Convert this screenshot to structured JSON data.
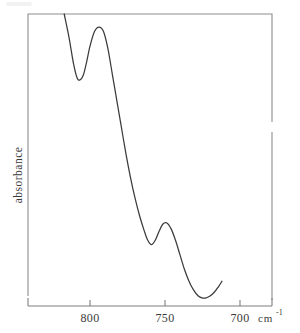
{
  "figure": {
    "name": "infrared-absorbance-spectrum",
    "background_color": "#ffffff",
    "curve_color": "#3b3b3b",
    "frame_color": "#8d8d8d"
  },
  "chart_data": {
    "type": "line",
    "title": "",
    "subtitle": "",
    "xlabel": "cm",
    "xlabel_superscript": "-1",
    "ylabel": "absorbance",
    "xticks": [
      800,
      750,
      700
    ],
    "xtick_labels": [
      "800",
      "750",
      "700"
    ],
    "xlim": [
      818,
      682
    ],
    "x_axis_direction": "decreasing",
    "ylim": [
      0,
      1
    ],
    "ytick_labels": [],
    "grid": false,
    "legend": null,
    "axis_frame": "left-top-right box with separate bottom axis line",
    "series": [
      {
        "name": "absorbance",
        "comment": "x in wavenumber cm^-1, y in relative absorbance (1 = top of frame, 0 = bottom axis)",
        "x": [
          817.2,
          814.0,
          811.0,
          808.5,
          806.5,
          804.5,
          802.5,
          800.0,
          797.0,
          794.0,
          791.0,
          788.0,
          785.0,
          782.0,
          779.0,
          776.0,
          773.0,
          770.0,
          767.0,
          764.0,
          761.5,
          759.0,
          756.5,
          754.0,
          751.5,
          749.0,
          746.0,
          743.0,
          740.0,
          737.0,
          734.0,
          731.0,
          728.0,
          725.5,
          723.0,
          720.0,
          717.0,
          714.5,
          712.0
        ],
        "y": [
          1.0,
          0.92,
          0.83,
          0.78,
          0.775,
          0.79,
          0.83,
          0.89,
          0.94,
          0.955,
          0.94,
          0.88,
          0.79,
          0.7,
          0.61,
          0.52,
          0.44,
          0.37,
          0.31,
          0.26,
          0.225,
          0.21,
          0.225,
          0.255,
          0.28,
          0.285,
          0.265,
          0.225,
          0.175,
          0.125,
          0.085,
          0.055,
          0.035,
          0.028,
          0.027,
          0.034,
          0.048,
          0.065,
          0.085
        ]
      }
    ],
    "features": [
      {
        "label": "local-minimum-1",
        "x": 806.0,
        "y": 0.775
      },
      {
        "label": "local-maximum-1",
        "x": 794.0,
        "y": 0.955
      },
      {
        "label": "local-minimum-2",
        "x": 759.5,
        "y": 0.21
      },
      {
        "label": "local-maximum-2",
        "x": 748.5,
        "y": 0.285
      },
      {
        "label": "local-minimum-3",
        "x": 723.5,
        "y": 0.027
      }
    ]
  },
  "axis": {
    "x_tick_label_0": "800",
    "x_tick_label_1": "750",
    "x_tick_label_2": "700",
    "unit_main": "cm",
    "unit_superscript": "-1",
    "y_title": "absorbance"
  }
}
